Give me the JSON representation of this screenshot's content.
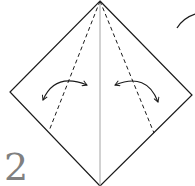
{
  "diagram": {
    "type": "origami-fold-step",
    "step_number": "2",
    "colors": {
      "line": "#1a1a1a",
      "center_crease": "#9a9a9a",
      "step_number": "#808080",
      "background": "#ffffff"
    },
    "shape": {
      "apex": [
        100,
        1
      ],
      "left": [
        10,
        92
      ],
      "right": [
        192,
        95
      ],
      "bottom": [
        100,
        186
      ]
    },
    "fold_lines": [
      {
        "name": "left-valley-fold",
        "style": "dashed",
        "from": [
          100,
          1
        ],
        "to": [
          49,
          131
        ]
      },
      {
        "name": "right-valley-fold",
        "style": "dashed",
        "from": [
          100,
          1
        ],
        "to": [
          154,
          133
        ]
      }
    ],
    "center_crease": {
      "from": [
        100,
        1
      ],
      "to": [
        100,
        186
      ]
    },
    "arrows": [
      {
        "name": "left-fold-arrow",
        "direction": "fold-and-unfold"
      },
      {
        "name": "right-fold-arrow",
        "direction": "fold-and-unfold"
      }
    ]
  }
}
